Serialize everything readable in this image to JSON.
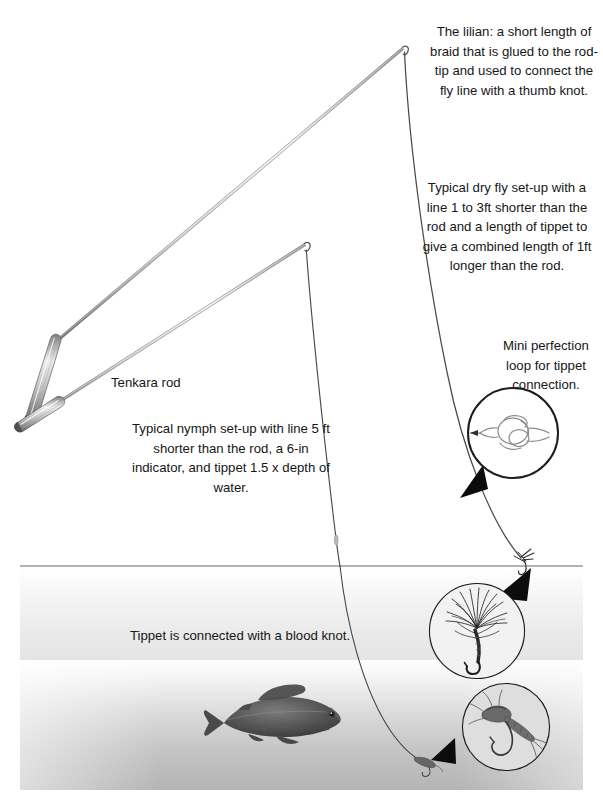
{
  "figure": {
    "background_color": "#ffffff",
    "ink_color": "#3a3a3a",
    "text_color": "#161616",
    "water_color": "#9a9a9a"
  },
  "annotations": {
    "lilian_note": "The lilian: a short length of braid that is glued to the rod-tip and used to connect the fly line with a thumb knot.",
    "dry_fly_note": "Typical dry fly set-up with a line 1 to 3ft shorter than the rod and a length of tippet to give a combined length of 1ft longer than the rod.",
    "perfection_loop_note": "Mini perfection loop for tippet connection.",
    "rod_label": "Tenkara rod",
    "nymph_note": "Typical nymph set-up with line 5 ft shorter than the rod, a 6-in indicator, and tippet 1.5 x depth of water.",
    "blood_knot_note": "Tippet is connected with a blood knot."
  },
  "elements": {
    "water_surface_label": "water-surface-line",
    "rod_upper_label": "tenkara-rod-dry-fly",
    "rod_lower_label": "tenkara-rod-nymph",
    "fish_label": "grayling-fish",
    "dry_fly_label": "dry-fly-on-surface",
    "nymph_label": "nymph-on-tippet"
  },
  "insets": {
    "perfection_loop": {
      "name": "perfection-loop-knot-inset",
      "center_x": 513,
      "center_y": 433,
      "radius": 45
    },
    "dry_fly_photo": {
      "name": "dry-fly-photo-inset",
      "center_x": 477,
      "center_y": 631,
      "radius": 47
    },
    "nymph_photo": {
      "name": "nymph-photo-inset",
      "center_x": 506,
      "center_y": 727,
      "radius": 43
    }
  },
  "geometry": {
    "canvas_width": 603,
    "canvas_height": 810,
    "water_line_y": 566,
    "water_line_x_start": 20,
    "water_line_x_end": 583,
    "rod_tip_dry_fly": [
      403,
      47
    ],
    "rod_tip_nymph": [
      305,
      244
    ],
    "rod_butt_dry_fly": [
      30,
      417
    ],
    "rod_butt_nymph": [
      55,
      338
    ]
  }
}
